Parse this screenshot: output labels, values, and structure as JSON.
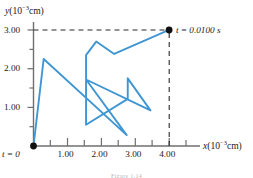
{
  "figure": {
    "y_axis_title": "y(10−3cm)",
    "x_axis_title": "x(10−3cm)",
    "start_label": "t = 0",
    "end_label": "t = 0.0100 s",
    "caption": "Figure 1.14"
  },
  "chart_data": {
    "type": "line",
    "title": "",
    "xlabel": "x(10−3cm)",
    "ylabel": "y(10−3cm)",
    "xlim": [
      0,
      4.4
    ],
    "ylim": [
      0,
      3.3
    ],
    "grid": false,
    "legend": null,
    "x_ticks_major": [
      1.0,
      2.0,
      3.0,
      4.0
    ],
    "x_tick_labels": [
      "1.00",
      "2.00",
      "3.00",
      "4.00"
    ],
    "x_ticks_minor": [
      0.5,
      1.5,
      2.5,
      3.5
    ],
    "y_ticks_major": [
      1.0,
      2.0,
      3.0
    ],
    "y_tick_labels": [
      "1.00",
      "2.00",
      "3.00"
    ],
    "y_ticks_minor": [
      0.5,
      1.5,
      2.5
    ],
    "series": [
      {
        "name": "particle-path",
        "color": "#3f96d2",
        "points": [
          [
            0.0,
            0.0
          ],
          [
            0.3,
            2.25
          ],
          [
            2.75,
            0.28
          ],
          [
            1.55,
            1.72
          ],
          [
            3.45,
            0.92
          ],
          [
            2.78,
            1.75
          ],
          [
            2.78,
            1.22
          ],
          [
            1.55,
            0.55
          ],
          [
            1.55,
            2.35
          ],
          [
            1.85,
            2.7
          ],
          [
            2.38,
            2.38
          ],
          [
            4.0,
            3.0
          ]
        ]
      }
    ],
    "annotations": [
      {
        "name": "start-point",
        "x": 0.0,
        "y": 0.0,
        "label": "t = 0",
        "marker": "filled-circle"
      },
      {
        "name": "end-point",
        "x": 4.0,
        "y": 3.0,
        "label": "t = 0.0100 s",
        "marker": "filled-circle"
      }
    ],
    "guides": [
      {
        "name": "horizontal-dashed-guide",
        "from": [
          0.0,
          3.0
        ],
        "to": [
          4.0,
          3.0
        ],
        "style": "dashed"
      },
      {
        "name": "vertical-dashed-guide",
        "from": [
          4.0,
          0.0
        ],
        "to": [
          4.0,
          3.0
        ],
        "style": "dashed"
      }
    ]
  }
}
